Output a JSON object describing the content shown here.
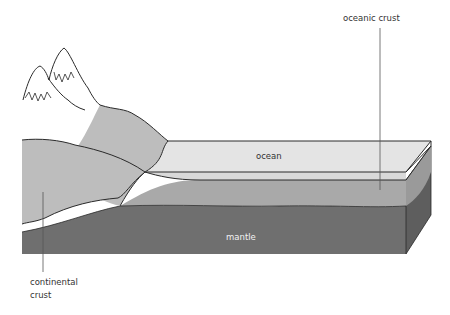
{
  "diagram": {
    "labels": {
      "oceanic_crust": "oceanic crust",
      "ocean": "ocean",
      "mantle": "mantle",
      "continental_crust_line1": "continental",
      "continental_crust_line2": "crust"
    },
    "colors": {
      "ocean_top": "#e4e4e4",
      "ocean_front": "#d6d6d6",
      "continental_crust": "#bdbdbd",
      "oceanic_crust": "#a9a9a9",
      "mantle": "#6f6f6f",
      "mantle_side": "#5e5e5e",
      "outline": "#2a2a2a"
    }
  }
}
